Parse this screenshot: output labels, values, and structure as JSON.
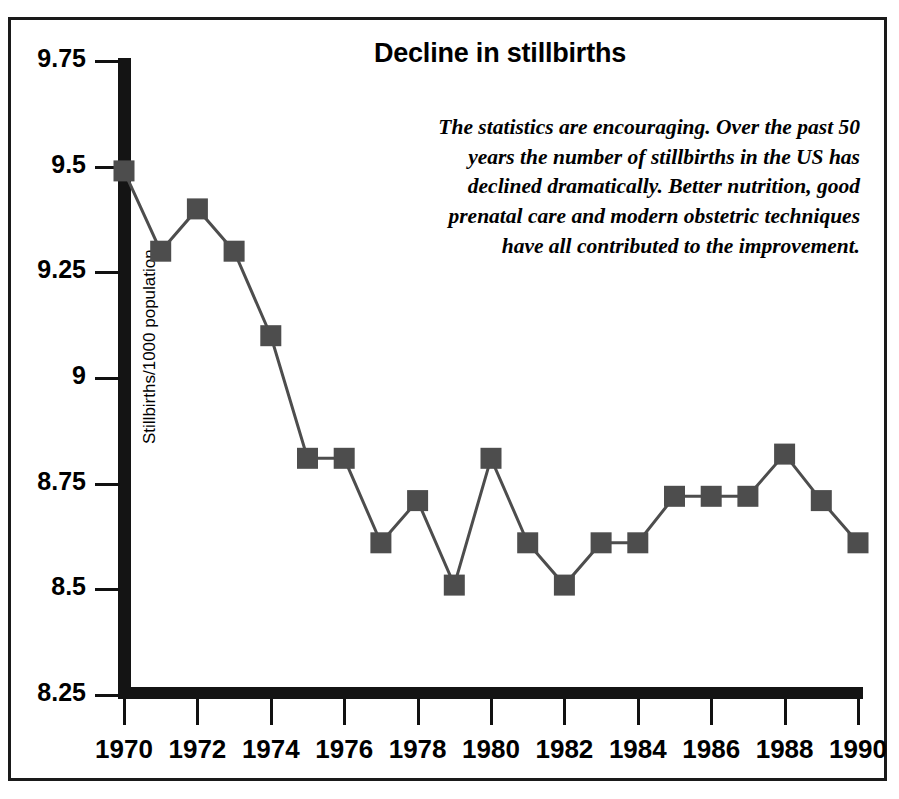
{
  "chart_data": {
    "type": "line",
    "title": "Decline in stillbirths",
    "xlabel": "",
    "ylabel": "Stillbirths/1000 population",
    "xlim": [
      1970,
      1990
    ],
    "ylim": [
      8.25,
      9.75
    ],
    "grid": false,
    "legend": "none",
    "marker": "square",
    "x": [
      1970,
      1971,
      1972,
      1973,
      1974,
      1975,
      1976,
      1977,
      1978,
      1979,
      1980,
      1981,
      1982,
      1983,
      1984,
      1985,
      1986,
      1987,
      1988,
      1989,
      1990
    ],
    "values": [
      9.49,
      9.3,
      9.4,
      9.3,
      9.1,
      8.81,
      8.81,
      8.61,
      8.71,
      8.51,
      8.81,
      8.61,
      8.51,
      8.61,
      8.61,
      8.72,
      8.72,
      8.72,
      8.82,
      8.71,
      8.61
    ],
    "y_ticks": [
      8.25,
      8.5,
      8.75,
      9,
      9.25,
      9.5,
      9.75
    ],
    "y_tick_labels": [
      "8.25",
      "8.5",
      "8.75",
      "9",
      "9.25",
      "9.5",
      "9.75"
    ],
    "x_ticks": [
      1970,
      1972,
      1974,
      1976,
      1978,
      1980,
      1982,
      1984,
      1986,
      1988,
      1990
    ],
    "x_tick_labels": [
      "1970",
      "1972",
      "1974",
      "1976",
      "1978",
      "1980",
      "1982",
      "1984",
      "1986",
      "1988",
      "1990"
    ],
    "annotation": "The statistics are encouraging. Over the past 50 years the number of stillbirths in the US has declined dramatically. Better nutrition, good prenatal care and modern obstetric techniques have all contributed to the improvement.",
    "colors": {
      "marker_fill": "#4d4d4d",
      "line": "#4d4d4d",
      "axis": "#141414",
      "text": "#000000",
      "background": "#ffffff",
      "frame": "#1a1a1a"
    }
  }
}
